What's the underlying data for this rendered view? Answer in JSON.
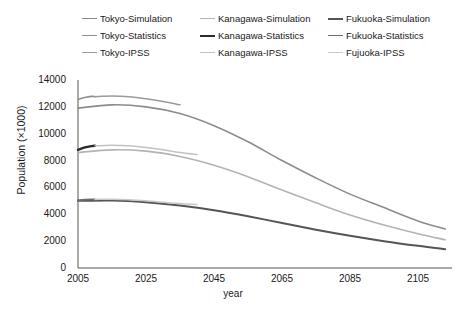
{
  "legend": {
    "rows": [
      [
        {
          "label": "Tokyo-Simulation",
          "color": "#8c8c8c",
          "width": 1.6
        },
        {
          "label": "Kanagawa-Simulation",
          "color": "#b3b3b3",
          "width": 1.6
        },
        {
          "label": "Fukuoka-Simulation",
          "color": "#555555",
          "width": 2.0
        }
      ],
      [
        {
          "label": "Tokyo-Statistics",
          "color": "#8f8f8f",
          "width": 1.6
        },
        {
          "label": "Kanagawa-Statistics",
          "color": "#2b2b2b",
          "width": 2.4
        },
        {
          "label": "Fukuoka-Statistics",
          "color": "#6e6e6e",
          "width": 1.8
        }
      ],
      [
        {
          "label": "Tokyo-IPSS",
          "color": "#9a9a9a",
          "width": 1.5
        },
        {
          "label": "Kanagawa-IPSS",
          "color": "#c2c2c2",
          "width": 1.5
        },
        {
          "label": "Fujuoka-IPSS",
          "color": "#c8c8c8",
          "width": 1.5
        }
      ]
    ]
  },
  "chart_data": {
    "type": "line",
    "title": "",
    "xlabel": "year",
    "ylabel": "Population (×1000)",
    "xlim": [
      2005,
      2115
    ],
    "ylim": [
      0,
      14000
    ],
    "xticks": [
      2005,
      2025,
      2045,
      2065,
      2085,
      2105
    ],
    "yticks": [
      0,
      2000,
      4000,
      6000,
      8000,
      10000,
      12000,
      14000
    ],
    "grid": false,
    "legend_position": "top",
    "series": [
      {
        "name": "Tokyo-Simulation",
        "color": "#8c8c8c",
        "width": 1.6,
        "x": [
          2005,
          2015,
          2025,
          2035,
          2045,
          2055,
          2065,
          2075,
          2085,
          2095,
          2105,
          2113
        ],
        "y": [
          11900,
          12150,
          12000,
          11500,
          10600,
          9400,
          8000,
          6700,
          5500,
          4500,
          3500,
          2900
        ]
      },
      {
        "name": "Tokyo-Statistics",
        "color": "#8f8f8f",
        "width": 1.6,
        "x": [
          2005,
          2007,
          2009,
          2010
        ],
        "y": [
          12550,
          12700,
          12780,
          12760
        ]
      },
      {
        "name": "Tokyo-IPSS",
        "color": "#9a9a9a",
        "width": 1.5,
        "x": [
          2010,
          2015,
          2020,
          2025,
          2030,
          2035
        ],
        "y": [
          12760,
          12800,
          12750,
          12600,
          12400,
          12150
        ]
      },
      {
        "name": "Kanagawa-Simulation",
        "color": "#b3b3b3",
        "width": 1.6,
        "x": [
          2005,
          2015,
          2025,
          2035,
          2045,
          2055,
          2065,
          2075,
          2085,
          2095,
          2105,
          2113
        ],
        "y": [
          8600,
          8800,
          8700,
          8300,
          7650,
          6800,
          5800,
          4850,
          3950,
          3200,
          2550,
          2100
        ]
      },
      {
        "name": "Kanagawa-Statistics",
        "color": "#2b2b2b",
        "width": 2.4,
        "x": [
          2005,
          2007,
          2009,
          2010
        ],
        "y": [
          8800,
          8980,
          9080,
          9100
        ]
      },
      {
        "name": "Kanagawa-IPSS",
        "color": "#c2c2c2",
        "width": 1.5,
        "x": [
          2010,
          2015,
          2020,
          2025,
          2030,
          2035,
          2040
        ],
        "y": [
          9100,
          9150,
          9100,
          8980,
          8800,
          8600,
          8450
        ]
      },
      {
        "name": "Fukuoka-Simulation",
        "color": "#555555",
        "width": 2.0,
        "x": [
          2005,
          2015,
          2025,
          2035,
          2045,
          2055,
          2065,
          2075,
          2085,
          2095,
          2105,
          2113
        ],
        "y": [
          5000,
          5030,
          4900,
          4650,
          4300,
          3850,
          3350,
          2850,
          2400,
          2000,
          1650,
          1400
        ]
      },
      {
        "name": "Fukuoka-Statistics",
        "color": "#6e6e6e",
        "width": 1.8,
        "x": [
          2005,
          2007,
          2009,
          2010
        ],
        "y": [
          5050,
          5090,
          5110,
          5110
        ]
      },
      {
        "name": "Fujuoka-IPSS",
        "color": "#c8c8c8",
        "width": 1.5,
        "x": [
          2010,
          2015,
          2020,
          2025,
          2030,
          2035,
          2040
        ],
        "y": [
          5110,
          5120,
          5080,
          5000,
          4900,
          4800,
          4720
        ]
      }
    ]
  }
}
